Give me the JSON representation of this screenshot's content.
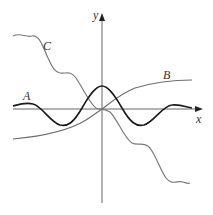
{
  "figure": {
    "axes": {
      "x_label": "x",
      "y_label": "y"
    },
    "curves": [
      {
        "id": "A",
        "label": "A",
        "color": "#1a1a1a",
        "description": "oscillating curve with central peak at y-axis"
      },
      {
        "id": "B",
        "label": "B",
        "color": "#6e6e6e",
        "description": "increasing S-shaped curve through origin"
      },
      {
        "id": "C",
        "label": "C",
        "color": "#7a7a7a",
        "description": "decreasing wavy curve through origin"
      }
    ]
  }
}
